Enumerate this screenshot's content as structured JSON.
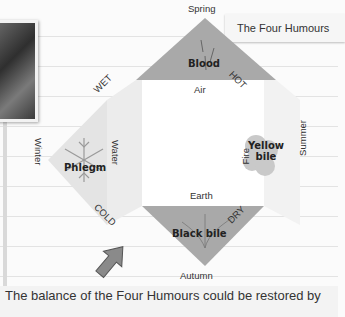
{
  "title": "The Four Humours",
  "humours": {
    "blood": {
      "label": "Blood",
      "element": "Air",
      "season": "Spring",
      "color": "#a9a9a9"
    },
    "phlegm": {
      "label": "Phlegm",
      "element": "Water",
      "season": "Winter",
      "color": "#dcdcdc"
    },
    "yellow_bile": {
      "label": "Yellow bile",
      "line1": "Yellow",
      "line2": "bile",
      "element": "Fire",
      "season": "Summer",
      "color": "#dcdcdc"
    },
    "black_bile": {
      "label": "Black bile",
      "element": "Earth",
      "season": "Autumn",
      "color": "#a9a9a9"
    }
  },
  "qualities": {
    "top_left": "WET",
    "top_right": "HOT",
    "bottom_left": "COLD",
    "bottom_right": "DRY"
  },
  "caption": "The balance of the Four Humours could be restored by",
  "caption_cut": "... This usually"
}
